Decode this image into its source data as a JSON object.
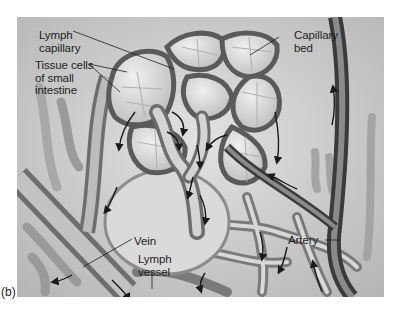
{
  "figure": {
    "panel_label": "(b)",
    "labels": {
      "lymph_capillary": [
        "Lymph",
        "capillary"
      ],
      "tissue_cells": [
        "Tissue cells",
        "of small",
        "intestine"
      ],
      "capillary_bed": [
        "Capillary",
        "bed"
      ],
      "vein": "Vein",
      "lymph_vessel": [
        "Lymph",
        "vessel"
      ],
      "artery": "Artery"
    },
    "colors": {
      "background": "#ffffff",
      "tissue": "#cfcfcf",
      "vessel_dark": "#4a4a4a",
      "vessel_mid": "#8a8a8a",
      "cell_light": "#e4e4e4",
      "arrow": "#1a1a1a",
      "text": "#1e1e1e"
    }
  }
}
